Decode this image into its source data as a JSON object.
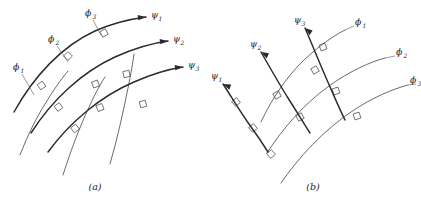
{
  "figure": {
    "background_color": "#ffffff",
    "ink_color": "#2b2b2b",
    "panels": [
      {
        "id": "a",
        "caption": "(a)",
        "directed_family": "psi",
        "labels": {
          "phi": [
            {
              "symbol": "ϕ",
              "subscript": "1"
            },
            {
              "symbol": "ϕ",
              "subscript": "2"
            },
            {
              "symbol": "ϕ",
              "subscript": "3"
            }
          ],
          "psi": [
            {
              "symbol": "ψ",
              "subscript": "1"
            },
            {
              "symbol": "ψ",
              "subscript": "2"
            },
            {
              "symbol": "ψ",
              "subscript": "3"
            }
          ]
        },
        "arrow_count": 3,
        "right_angle_marker_count": 9
      },
      {
        "id": "b",
        "caption": "(b)",
        "directed_family": "psi",
        "labels": {
          "phi": [
            {
              "symbol": "ϕ",
              "subscript": "1"
            },
            {
              "symbol": "ϕ",
              "subscript": "2"
            },
            {
              "symbol": "ϕ",
              "subscript": "3"
            }
          ],
          "psi": [
            {
              "symbol": "ψ",
              "subscript": "1"
            },
            {
              "symbol": "ψ",
              "subscript": "2"
            },
            {
              "symbol": "ψ",
              "subscript": "3"
            }
          ]
        },
        "arrow_count": 3,
        "right_angle_marker_count": 9
      }
    ]
  }
}
